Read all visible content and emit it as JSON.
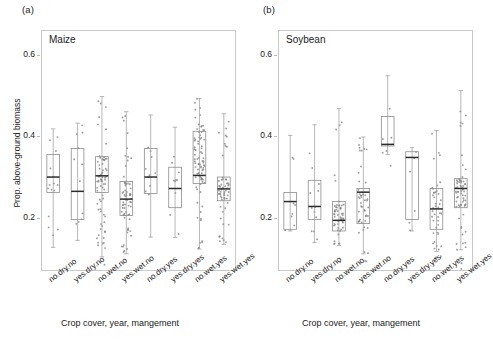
{
  "figure": {
    "panel_a_letter": "(a)",
    "panel_b_letter": "(b)",
    "panel_a_title": "Maize",
    "panel_b_title": "Soybean",
    "ylabel": "Prop. above-ground biomass",
    "xlabel": "Crop cover, year, mangement",
    "accent_color": "#2b2b2b",
    "box_stroke": "#8d8d8d",
    "point_color": "#7d7d7d"
  },
  "chart_data": [
    {
      "type": "box",
      "title": "Maize",
      "panel": "(a)",
      "xlabel": "Crop cover, year, mangement",
      "ylabel": "Prop. above-ground biomass",
      "ylim": [
        0.07,
        0.66
      ],
      "yticks": [
        0.2,
        0.4,
        0.6
      ],
      "ytick_labels": [
        "0.2",
        "0.4",
        "0.6"
      ],
      "grid": false,
      "legend": "none",
      "categories": [
        "no.dry.no",
        "yes.dry.no",
        "no.wet.no",
        "yes.wet.no",
        "no.dry.yes",
        "yes.dry.yes",
        "no.wet.yes",
        "yes.wet.yes"
      ],
      "boxes": [
        {
          "category": "no.dry.no",
          "whisker_low": 0.128,
          "q1": 0.262,
          "median": 0.3,
          "q3": 0.355,
          "whisker_high": 0.418,
          "n": 14
        },
        {
          "category": "yes.dry.no",
          "whisker_low": 0.145,
          "q1": 0.196,
          "median": 0.265,
          "q3": 0.37,
          "whisker_high": 0.432,
          "n": 12
        },
        {
          "category": "no.wet.no",
          "whisker_low": 0.105,
          "q1": 0.262,
          "median": 0.303,
          "q3": 0.35,
          "whisker_high": 0.497,
          "n": 72
        },
        {
          "category": "yes.wet.no",
          "whisker_low": 0.112,
          "q1": 0.206,
          "median": 0.246,
          "q3": 0.289,
          "whisker_high": 0.46,
          "n": 66
        },
        {
          "category": "no.dry.yes",
          "whisker_low": 0.153,
          "q1": 0.26,
          "median": 0.3,
          "q3": 0.37,
          "whisker_high": 0.452,
          "n": 11
        },
        {
          "category": "yes.dry.yes",
          "whisker_low": 0.152,
          "q1": 0.225,
          "median": 0.272,
          "q3": 0.324,
          "whisker_high": 0.422,
          "n": 10
        },
        {
          "category": "no.wet.yes",
          "whisker_low": 0.124,
          "q1": 0.284,
          "median": 0.304,
          "q3": 0.412,
          "whisker_high": 0.492,
          "n": 82
        },
        {
          "category": "yes.wet.yes",
          "whisker_low": 0.135,
          "q1": 0.242,
          "median": 0.271,
          "q3": 0.3,
          "whisker_high": 0.455,
          "n": 58
        }
      ]
    },
    {
      "type": "box",
      "title": "Soybean",
      "panel": "(b)",
      "xlabel": "Crop cover, year, mangement",
      "ylabel": "Prop. above-ground biomass",
      "ylim": [
        0.07,
        0.66
      ],
      "yticks": [
        0.2,
        0.4,
        0.6
      ],
      "ytick_labels": [
        "0.2",
        "0.4",
        "0.6"
      ],
      "grid": false,
      "legend": "none",
      "categories": [
        "no.dry.no",
        "yes.dry.no",
        "no.wet.no",
        "yes.wet.no",
        "no.dry.yes",
        "yes.dry.yes",
        "no.wet.yes",
        "yes.wet.yes"
      ],
      "boxes": [
        {
          "category": "no.dry.no",
          "whisker_low": 0.168,
          "q1": 0.172,
          "median": 0.24,
          "q3": 0.262,
          "whisker_high": 0.402,
          "n": 8
        },
        {
          "category": "yes.dry.no",
          "whisker_low": 0.14,
          "q1": 0.196,
          "median": 0.228,
          "q3": 0.292,
          "whisker_high": 0.428,
          "n": 12
        },
        {
          "category": "no.wet.no",
          "whisker_low": 0.132,
          "q1": 0.168,
          "median": 0.194,
          "q3": 0.24,
          "whisker_high": 0.468,
          "n": 54
        },
        {
          "category": "yes.wet.no",
          "whisker_low": 0.112,
          "q1": 0.186,
          "median": 0.263,
          "q3": 0.272,
          "whisker_high": 0.398,
          "n": 50
        },
        {
          "category": "no.dry.yes",
          "whisker_low": 0.355,
          "q1": 0.376,
          "median": 0.38,
          "q3": 0.448,
          "whisker_high": 0.548,
          "n": 7
        },
        {
          "category": "yes.dry.yes",
          "whisker_low": 0.168,
          "q1": 0.196,
          "median": 0.348,
          "q3": 0.362,
          "whisker_high": 0.372,
          "n": 6
        },
        {
          "category": "no.wet.yes",
          "whisker_low": 0.118,
          "q1": 0.172,
          "median": 0.222,
          "q3": 0.272,
          "whisker_high": 0.414,
          "n": 44
        },
        {
          "category": "yes.wet.yes",
          "whisker_low": 0.122,
          "q1": 0.225,
          "median": 0.272,
          "q3": 0.296,
          "whisker_high": 0.512,
          "n": 66
        }
      ]
    }
  ]
}
